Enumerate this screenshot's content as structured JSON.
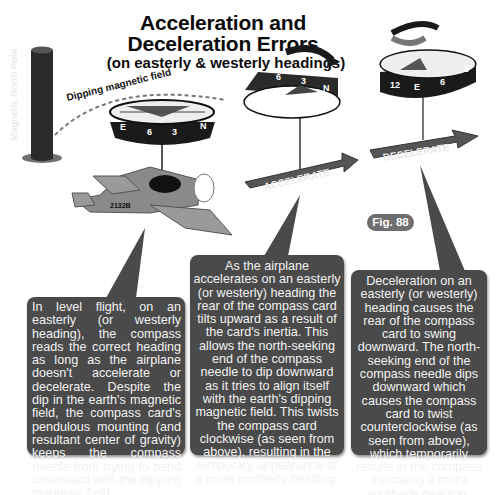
{
  "header": {
    "title_line1": "Acceleration and",
    "title_line2": "Deceleration Errors",
    "subtitle": "(on easterly & westerly headings)"
  },
  "figure_label": "Fig. 88",
  "labels": {
    "magnetic_pole": "Magnetic North Pole",
    "dipping_field": "Dipping magnetic field",
    "airplane_registration": "2132B",
    "accelerate_arrow": "ACCELERATE",
    "decelerate_arrow": "DECELERATE"
  },
  "compasses": {
    "level": {
      "marks": [
        "E",
        "6",
        "3",
        "N"
      ]
    },
    "accelerate": {
      "marks": [
        "6",
        "3",
        "N"
      ],
      "rotation": "clockwise"
    },
    "decelerate": {
      "marks": [
        "12",
        "E",
        "6",
        "3"
      ],
      "rotation": "counter-clockwise"
    }
  },
  "callouts": {
    "level_flight": "In level flight, on an easterly (or westerly heading), the compass reads the correct heading as long as the airplane doesn't accelerate or decelerate. Despite the dip in the earth's magnetic field, the compass card's pendulous mounting (and resultant center of gravity) keeps the compass needle from trying to bend downward with the dipping magnetic field.",
    "acceleration": "As the airplane accelerates on an easterly (or westerly) heading the rear of the compass card tilts upward as a result of the card's inertia. This allows the north-seeking end of the compass needle to dip downward as it tries to align itself with the earth's dipping magnetic field. This twists the compass card clockwise (as seen from above), resulting in the temporary appearance of a more northerly heading.",
    "deceleration": "Deceleration on an easterly (or westerly) heading causes the rear of the compass card to swing downward. The north-seeking end of the compass needle dips downward which causes the compass card to twist counterclockwise (as seen from above), which temporarily results in the compass indicating a more southerly heading."
  },
  "colors": {
    "box_fill": "#4a4a4a",
    "box_text": "#f2f2f2",
    "compass_dark": "#1a1a1a",
    "airplane_gray": "#8a8a8a",
    "badge_fill": "#6e6e6e"
  }
}
